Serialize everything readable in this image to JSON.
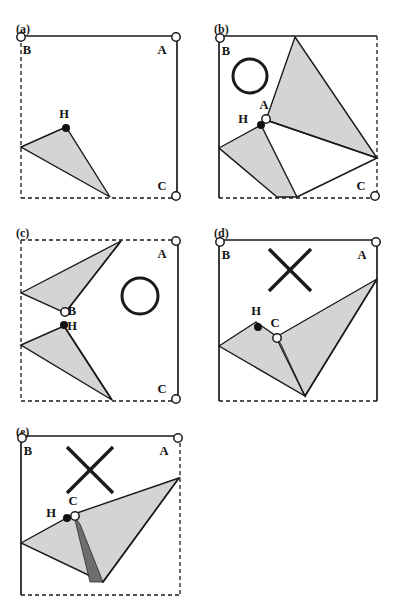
{
  "figure": {
    "type": "multi-panel-geometry-diagram",
    "panel_count": 5,
    "width": 396,
    "height": 613,
    "background": "#ffffff",
    "colors": {
      "outline": "#1a1a1a",
      "triangle_fill_light": "#d4d4d4",
      "triangle_fill_dark": "#6e6e6e",
      "marker_open_fill": "#ffffff",
      "marker_closed_fill": "#111111",
      "annotation_stroke": "#1a1a1a"
    },
    "legend_semantics": {
      "open_circle": "candidate / goal node marker",
      "filled_dot": "H heuristic point marker",
      "dashed_edge": "open or unconstrained boundary",
      "solid_edge": "closed or constrained boundary",
      "circle_annotation": "accepted configuration mark",
      "cross_annotation": "rejected configuration mark",
      "light_gray_region": "swept / visible region",
      "dark_gray_region": "overlap region"
    }
  },
  "panels": [
    {
      "id": "a",
      "label": "(a)",
      "label_x": 16,
      "label_y": 22,
      "box": {
        "x": 21,
        "y": 36,
        "w": 156,
        "h": 162
      },
      "edges": {
        "top": "solid",
        "right": "solid",
        "bottom": "dashed",
        "left": "dashed"
      },
      "annotation": "none",
      "markers": [
        {
          "name": "B",
          "type": "open",
          "x": 21,
          "y": 37,
          "label_dx": 6,
          "label_dy": 17
        },
        {
          "name": "A",
          "type": "open",
          "x": 176,
          "y": 37,
          "label_dx": -14,
          "label_dy": 17
        },
        {
          "name": "C",
          "type": "open",
          "x": 176,
          "y": 196,
          "label_dx": -14,
          "label_dy": -6
        },
        {
          "name": "H",
          "type": "closed",
          "x": 66,
          "y": 128,
          "label_dx": -2,
          "label_dy": -10
        }
      ],
      "regions": [
        {
          "fill": "light",
          "points": "21,147 66,127 110,197"
        }
      ]
    },
    {
      "id": "b",
      "label": "(b)",
      "label_x": 214,
      "label_y": 22,
      "box": {
        "x": 219,
        "y": 36,
        "w": 158,
        "h": 162
      },
      "edges": {
        "top": "solid",
        "right": "dashed",
        "bottom": "dashed",
        "left": "solid"
      },
      "annotation": "circle",
      "annotation_shape": {
        "cx": 250,
        "cy": 76,
        "r": 17
      },
      "markers": [
        {
          "name": "B",
          "type": "open",
          "x": 220,
          "y": 38,
          "label_dx": 6,
          "label_dy": 17
        },
        {
          "name": "A",
          "type": "open",
          "x": 266,
          "y": 119,
          "label_dx": -2,
          "label_dy": -10
        },
        {
          "name": "H",
          "type": "closed",
          "x": 261,
          "y": 125,
          "label_dx": -18,
          "label_dy": -2
        },
        {
          "name": "C",
          "type": "open",
          "x": 375,
          "y": 196,
          "label_dx": -14,
          "label_dy": -6
        }
      ],
      "regions": [
        {
          "fill": "light",
          "points": "295,37 377,158 266,120"
        },
        {
          "fill": "light",
          "points": "261,125 219,148 277,197 297,197"
        }
      ],
      "extra_lines": [
        {
          "x1": 266,
          "y1": 120,
          "x2": 377,
          "y2": 158
        },
        {
          "x1": 377,
          "y1": 158,
          "x2": 297,
          "y2": 197
        }
      ]
    },
    {
      "id": "c",
      "label": "(c)",
      "label_x": 16,
      "label_y": 226,
      "box": {
        "x": 21,
        "y": 240,
        "w": 157,
        "h": 161
      },
      "edges": {
        "top": "dashed",
        "right": "solid",
        "bottom": "dashed",
        "left": "dashed"
      },
      "annotation": "circle",
      "annotation_shape": {
        "cx": 140,
        "cy": 296,
        "r": 18
      },
      "markers": [
        {
          "name": "A",
          "type": "open",
          "x": 176,
          "y": 241,
          "label_dx": -14,
          "label_dy": 17
        },
        {
          "name": "B",
          "type": "open",
          "x": 65,
          "y": 312,
          "label_dx": 7,
          "label_dy": 3
        },
        {
          "name": "H",
          "type": "closed",
          "x": 64,
          "y": 325,
          "label_dx": 8,
          "label_dy": 5
        },
        {
          "name": "C",
          "type": "open",
          "x": 176,
          "y": 399,
          "label_dx": -14,
          "label_dy": -6
        }
      ],
      "regions": [
        {
          "fill": "light",
          "points": "21,293 121,241 65,313"
        },
        {
          "fill": "light",
          "points": "21,345 64,326 112,400"
        }
      ],
      "extra_lines": [
        {
          "x1": 121,
          "y1": 241,
          "x2": 65,
          "y2": 313
        },
        {
          "x1": 64,
          "y1": 326,
          "x2": 112,
          "y2": 400
        }
      ]
    },
    {
      "id": "d",
      "label": "(d)",
      "label_x": 214,
      "label_y": 226,
      "box": {
        "x": 219,
        "y": 240,
        "w": 158,
        "h": 161
      },
      "edges": {
        "top": "solid",
        "right": "solid",
        "bottom": "dashed",
        "left": "solid"
      },
      "annotation": "cross",
      "annotation_shape": {
        "cx": 290,
        "cy": 270,
        "size": 21
      },
      "markers": [
        {
          "name": "B",
          "type": "open",
          "x": 220,
          "y": 242,
          "label_dx": 6,
          "label_dy": 17
        },
        {
          "name": "A",
          "type": "open",
          "x": 376,
          "y": 242,
          "label_dx": -14,
          "label_dy": 17
        },
        {
          "name": "H",
          "type": "closed",
          "x": 258,
          "y": 327,
          "label_dx": -2,
          "label_dy": -12
        },
        {
          "name": "C",
          "type": "open",
          "x": 277,
          "y": 338,
          "label_dx": -2,
          "label_dy": -11
        }
      ],
      "regions": [
        {
          "fill": "light",
          "points": "219,346 256,322 276,336 305,396"
        },
        {
          "fill": "light",
          "points": "276,337 377,279 305,396"
        },
        {
          "fill": "dark",
          "points": "276,337 281,344 305,396"
        }
      ],
      "extra_lines": [
        {
          "x1": 377,
          "y1": 279,
          "x2": 305,
          "y2": 396
        }
      ]
    },
    {
      "id": "e",
      "label": "(e)",
      "label_x": 16,
      "label_y": 425,
      "box": {
        "x": 21,
        "y": 436,
        "w": 159,
        "h": 159
      },
      "edges": {
        "top": "solid",
        "right": "dashed",
        "bottom": "dashed",
        "left": "solid"
      },
      "annotation": "cross",
      "annotation_shape": {
        "cx": 90,
        "cy": 470,
        "size": 23
      },
      "markers": [
        {
          "name": "B",
          "type": "open",
          "x": 22,
          "y": 438,
          "label_dx": 6,
          "label_dy": 17
        },
        {
          "name": "A",
          "type": "open",
          "x": 178,
          "y": 438,
          "label_dx": -14,
          "label_dy": 17
        },
        {
          "name": "H",
          "type": "closed",
          "x": 67,
          "y": 518,
          "label_dx": -16,
          "label_dy": -1
        },
        {
          "name": "C",
          "type": "open",
          "x": 75,
          "y": 516,
          "label_dx": -2,
          "label_dy": -11
        }
      ],
      "regions": [
        {
          "fill": "light",
          "points": "21,543 74,514 179,478 103,582"
        },
        {
          "fill": "dark",
          "points": "74,516 80,524 103,582 90,582"
        }
      ],
      "extra_lines": [
        {
          "x1": 179,
          "y1": 478,
          "x2": 103,
          "y2": 582
        }
      ]
    }
  ]
}
